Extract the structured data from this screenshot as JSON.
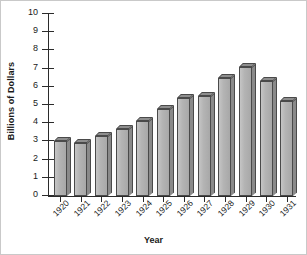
{
  "chart_data": {
    "type": "bar",
    "title": "",
    "xlabel": "Year",
    "ylabel": "Billions of Dollars",
    "categories": [
      "1920",
      "1921",
      "1922",
      "1923",
      "1924",
      "1925",
      "1926",
      "1927",
      "1928",
      "1929",
      "1930",
      "1931"
    ],
    "values": [
      3.0,
      2.9,
      3.3,
      3.7,
      4.1,
      4.8,
      5.4,
      5.5,
      6.5,
      7.1,
      6.3,
      5.2
    ],
    "ylim": [
      0,
      10
    ],
    "yticks": [
      "0",
      "1",
      "2",
      "3",
      "4",
      "5",
      "6",
      "7",
      "8",
      "9",
      "10"
    ],
    "ytick_values": [
      0,
      1,
      2,
      3,
      4,
      5,
      6,
      7,
      8,
      9,
      10
    ],
    "grid": false,
    "legend": null,
    "legend_position": "none",
    "bar_style": "3d-extruded",
    "colors": {
      "bar_face": "#b4b4b4",
      "bar_top": "#8e8e8e",
      "bar_side": "#8a8a8a",
      "bar_edge": "#4a4a4a",
      "axis": "#2b2b2b",
      "text": "#1a1a1a",
      "background": "#ffffff",
      "border": "#c9c9c9"
    }
  }
}
